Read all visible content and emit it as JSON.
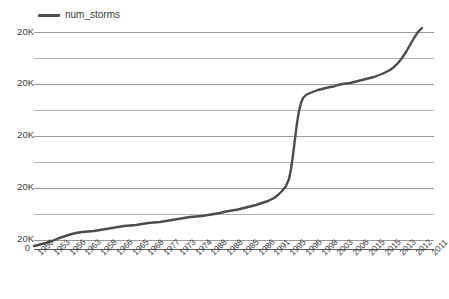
{
  "legend": {
    "position": "top-left",
    "entries": [
      {
        "label": "num_storms",
        "color": "#4d4d4d",
        "icon": "line-swatch-icon"
      }
    ]
  },
  "axes": {
    "y_labels": [
      "20K",
      "20K",
      "20K",
      "20K",
      "20K"
    ],
    "y_zero_label": "0",
    "x_labels": [
      "1950",
      "1953",
      "1956",
      "1963",
      "1958",
      "1966",
      "1965",
      "1968",
      "1977",
      "1973",
      "1974",
      "1988",
      "1988",
      "1985",
      "1986",
      "1991",
      "1995",
      "1996",
      "1998",
      "2003",
      "2006",
      "2015",
      "2015",
      "2013",
      "2012",
      "2011"
    ]
  },
  "chart_data": {
    "type": "line",
    "title": "",
    "subtitle": "",
    "xlabel": "",
    "ylabel": "",
    "grid": true,
    "legend_position": "top-left",
    "ylim": [
      0,
      20000
    ],
    "y_tick_labels": [
      "0",
      "20K",
      "20K",
      "20K",
      "20K",
      "20K"
    ],
    "y_tick_values": [
      0,
      4000,
      8000,
      12000,
      16000,
      20000
    ],
    "minor_gridlines": true,
    "x_tick_labels": [
      "1950",
      "1953",
      "1956",
      "1963",
      "1958",
      "1966",
      "1965",
      "1968",
      "1977",
      "1973",
      "1974",
      "1988",
      "1988",
      "1985",
      "1986",
      "1991",
      "1995",
      "1996",
      "1998",
      "2003",
      "2006",
      "2015",
      "2015",
      "2013",
      "2012",
      "2011"
    ],
    "series": [
      {
        "name": "num_storms",
        "color": "#4d4d4d",
        "x": [
          "1950",
          "1953",
          "1956",
          "1963",
          "1958",
          "1966",
          "1965",
          "1968",
          "1977",
          "1973",
          "1974",
          "1988",
          "1988",
          "1985",
          "1986",
          "1991",
          "1995",
          "1996",
          "1998",
          "2003",
          "2006",
          "2015",
          "2015",
          "2013",
          "2012",
          "2011"
        ],
        "values": [
          150,
          420,
          700,
          880,
          1000,
          1120,
          1250,
          1400,
          1600,
          1750,
          1900,
          2150,
          2400,
          2750,
          3300,
          4150,
          11300,
          11900,
          12300,
          13100,
          13700,
          14700,
          15400,
          16300,
          17600,
          20000
        ]
      }
    ],
    "annotations": [
      "Sharp near-vertical rise between 1991 and 1995",
      "Flat low plateau from 1950 through late 1980s",
      "Gradual climb after 1996 steepening at the right edge"
    ]
  },
  "series_path": "M 0,219 L 6,217.5 L 12,216 L 18,214 L 24,211.5 L 30,209.5 L 36,207.5 L 42,206 L 48,205 L 54,204.5 L 60,204 L 66,203 L 72,202 L 78,201 L 84,200 L 90,199 L 96,198.5 L 102,198 L 108,197 L 114,196 L 120,195.5 L 126,195 L 132,194 L 138,193 L 144,192 L 150,191 L 156,190 L 162,189.5 L 168,189 L 174,188 L 180,187 L 186,186 L 192,184.5 L 198,183.5 L 204,182.5 L 210,181 L 216,179.5 L 222,178 L 228,176 L 234,174 L 240,171 L 244,168 L 248,164 L 252,159 L 255,152 L 257,142 L 259,128 L 261,112 L 263,96 L 265,84 L 267,76 L 269,71 L 272,68 L 276,66 L 280,64.5 L 284,63 L 288,62 L 292,61 L 296,60 L 300,59.5 L 304,58 L 308,57 L 312,56.5 L 316,56 L 320,55 L 324,54 L 328,53 L 332,52 L 336,51 L 340,50 L 344,48.5 L 348,47 L 352,45 L 356,43 L 360,40 L 364,36 L 368,31 L 372,25 L 376,18 L 380,11 L 384,5 L 388,1"
}
